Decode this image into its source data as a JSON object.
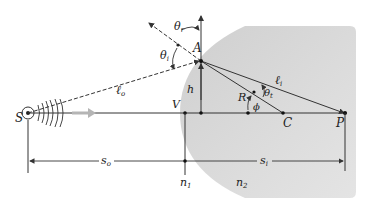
{
  "diagram": {
    "type": "refraction at spherical surface",
    "labels": {
      "source": "S",
      "vertex": "V",
      "incidence_point": "A",
      "height": "h",
      "radius": "R",
      "center": "C",
      "image_point": "P",
      "theta_r": "θ",
      "theta_r_sub": "r",
      "theta_i": "θ",
      "theta_i_sub": "i",
      "theta_t": "θ",
      "theta_t_sub": "t",
      "phi": "ϕ",
      "l_o": "ℓ",
      "l_o_sub": "o",
      "l_i": "ℓ",
      "l_i_sub": "i",
      "s_o": "s",
      "s_o_sub": "o",
      "s_i": "s",
      "s_i_sub": "i",
      "n1": "n",
      "n1_sub": "1",
      "n2": "n",
      "n2_sub": "2"
    },
    "colors": {
      "medium_fill": "#d4d4d4",
      "medium_fill_light": "#e6e6e6",
      "line": "#333333",
      "arrow_gray": "#b5b5b5"
    }
  }
}
